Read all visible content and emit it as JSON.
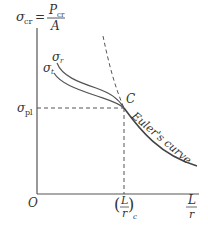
{
  "diagram": {
    "y_axis": {
      "label_lhs": "σ",
      "label_lhs_sub": "cr",
      "equals": "=",
      "label_num": "P",
      "label_num_sub": "cr",
      "label_den": "A"
    },
    "x_axis": {
      "label_num": "L",
      "label_den": "r"
    },
    "origin_label": "O",
    "sigma_pl": {
      "symbol": "σ",
      "sub": "pl"
    },
    "sigma_r": {
      "symbol": "σ",
      "sub": "r"
    },
    "sigma_t": {
      "symbol": "σ",
      "sub": "t"
    },
    "point_label": "C",
    "critical_ratio": {
      "open": "(",
      "num": "L",
      "den": "r",
      "close": ")",
      "sub": "c"
    },
    "curve_label": "Euler's curve",
    "colors": {
      "stroke": "#555555",
      "text": "#333333",
      "background": "#ffffff"
    }
  }
}
